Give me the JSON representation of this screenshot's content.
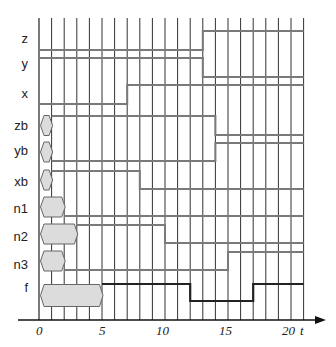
{
  "diagram": {
    "type": "timing",
    "axis": {
      "label": "t",
      "ticks": [
        {
          "t": 0,
          "label": "0"
        },
        {
          "t": 5,
          "label": "5"
        },
        {
          "t": 10,
          "label": "10"
        },
        {
          "t": 15,
          "label": "15"
        },
        {
          "t": 20,
          "label": "20"
        }
      ],
      "t_min": 0,
      "t_max": 21
    },
    "colors": {
      "grid": "#333333",
      "signal": "#7a7a7a",
      "output": "#222222",
      "bus_fill": "#dcdcdc",
      "bus_stroke": "#666666"
    },
    "signals": [
      {
        "name": "z",
        "label": "z"
      },
      {
        "name": "y",
        "label": "y"
      },
      {
        "name": "x",
        "label": "x"
      },
      {
        "name": "zb",
        "label": "zb"
      },
      {
        "name": "yb",
        "label": "yb"
      },
      {
        "name": "xb",
        "label": "xb"
      },
      {
        "name": "n1",
        "label": "n1"
      },
      {
        "name": "n2",
        "label": "n2"
      },
      {
        "name": "n3",
        "label": "n3"
      },
      {
        "name": "f",
        "label": "f"
      }
    ],
    "waveforms": {
      "z": {
        "unknown_until": 0,
        "segments": [
          {
            "from": 0,
            "to": 13,
            "level": 0
          },
          {
            "from": 13,
            "to": 21,
            "level": 1
          }
        ]
      },
      "y": {
        "unknown_until": 0,
        "segments": [
          {
            "from": 0,
            "to": 13,
            "level": 1
          },
          {
            "from": 13,
            "to": 21,
            "level": 0
          }
        ]
      },
      "x": {
        "unknown_until": 0,
        "segments": [
          {
            "from": 0,
            "to": 7,
            "level": 0
          },
          {
            "from": 7,
            "to": 21,
            "level": 1
          }
        ]
      },
      "zb": {
        "unknown_until": 1,
        "segments": [
          {
            "from": 1,
            "to": 14,
            "level": 1
          },
          {
            "from": 14,
            "to": 21,
            "level": 0
          }
        ]
      },
      "yb": {
        "unknown_until": 1,
        "segments": [
          {
            "from": 1,
            "to": 14,
            "level": 0
          },
          {
            "from": 14,
            "to": 21,
            "level": 1
          }
        ]
      },
      "xb": {
        "unknown_until": 1,
        "segments": [
          {
            "from": 1,
            "to": 8,
            "level": 1
          },
          {
            "from": 8,
            "to": 21,
            "level": 0
          }
        ]
      },
      "n1": {
        "unknown_until": 2,
        "segments": [
          {
            "from": 2,
            "to": 21,
            "level": 0
          }
        ]
      },
      "n2": {
        "unknown_until": 3,
        "segments": [
          {
            "from": 3,
            "to": 10,
            "level": 1
          },
          {
            "from": 10,
            "to": 21,
            "level": 0
          }
        ]
      },
      "n3": {
        "unknown_until": 2,
        "segments": [
          {
            "from": 2,
            "to": 15,
            "level": 0
          },
          {
            "from": 15,
            "to": 21,
            "level": 1
          }
        ]
      },
      "f": {
        "unknown_until": 5,
        "segments": [
          {
            "from": 5,
            "to": 12,
            "level": 1
          },
          {
            "from": 12,
            "to": 17,
            "level": 0
          },
          {
            "from": 17,
            "to": 21,
            "level": 1
          }
        ]
      }
    }
  }
}
